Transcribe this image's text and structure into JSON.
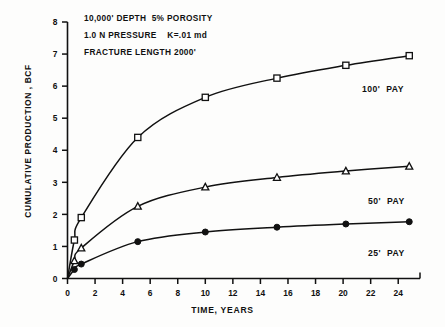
{
  "figure": {
    "annotations": [
      "10,000' DEPTH  5% POROSITY",
      "1.0 N PRESSURE    K=.01 md",
      "FRACTURE LENGTH 2000'"
    ]
  },
  "axis": {
    "xlabel": "TIME, YEARS",
    "ylabel": "CUMULATIVE PRODUCTION , BCF",
    "xticks": [
      "0",
      "2",
      "4",
      "6",
      "8",
      "10",
      "12",
      "14",
      "16",
      "18",
      "20",
      "22",
      "24"
    ],
    "yticks": [
      "0",
      "1",
      "2",
      "3",
      "4",
      "5",
      "6",
      "7",
      "8"
    ]
  },
  "labels": {
    "pay100": "100'  PAY",
    "pay50": "50'  PAY",
    "pay25": "25'  PAY"
  },
  "chart_data": {
    "type": "line",
    "title": "",
    "xlabel": "TIME, YEARS",
    "ylabel": "CUMULATIVE PRODUCTION , BCF",
    "xlim": [
      0,
      25
    ],
    "ylim": [
      0,
      8
    ],
    "xticks": [
      0,
      2,
      4,
      6,
      8,
      10,
      12,
      14,
      16,
      18,
      20,
      22,
      24
    ],
    "yticks": [
      0,
      1,
      2,
      3,
      4,
      5,
      6,
      7,
      8
    ],
    "grid": false,
    "legend_position": "right-inline",
    "annotations": [
      "10,000' DEPTH  5% POROSITY",
      "1.0 N PRESSURE    K=.01 md",
      "FRACTURE LENGTH 2000'"
    ],
    "series": [
      {
        "name": "100'  PAY",
        "marker": "open-square",
        "x": [
          0.5,
          1.0,
          5.1,
          10.0,
          15.2,
          20.2,
          24.8
        ],
        "values": [
          1.2,
          1.9,
          4.4,
          5.65,
          6.25,
          6.65,
          6.95
        ]
      },
      {
        "name": "50'  PAY",
        "marker": "open-triangle",
        "x": [
          0.5,
          1.0,
          5.1,
          10.0,
          15.2,
          20.2,
          24.8
        ],
        "values": [
          0.55,
          0.95,
          2.25,
          2.85,
          3.15,
          3.35,
          3.5
        ]
      },
      {
        "name": "25'  PAY",
        "marker": "filled-circle",
        "x": [
          0.5,
          1.0,
          5.1,
          10.0,
          15.2,
          20.2,
          24.8
        ],
        "values": [
          0.28,
          0.45,
          1.15,
          1.45,
          1.6,
          1.7,
          1.77
        ]
      }
    ]
  }
}
